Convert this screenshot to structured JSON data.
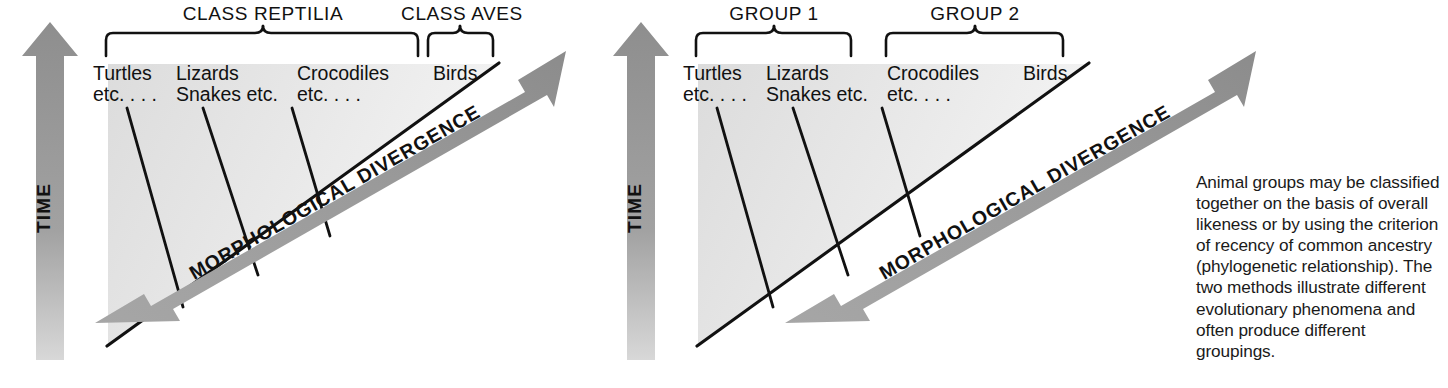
{
  "figure": {
    "background_color": "#ffffff",
    "wedge_fill_color": "#e6e6e6",
    "arrow_color": "#9a9a9a",
    "line_color": "#111111"
  },
  "panels": [
    {
      "id": "panel-left",
      "scheme": "phenetic",
      "time_axis_label": "TIME",
      "divergence_axis_label": "MORPHOLOGICAL DIVERGENCE",
      "group_labels": [
        {
          "text": "CLASS REPTILIA",
          "spans": [
            "Turtles etc....",
            "Lizards Snakes etc.",
            "Crocodiles etc...."
          ]
        },
        {
          "text": "CLASS AVES",
          "spans": [
            "Birds"
          ]
        }
      ],
      "leaves": [
        {
          "line1": "Turtles",
          "line2": "etc. . . ."
        },
        {
          "line1": "Lizards",
          "line2": "Snakes etc."
        },
        {
          "line1": "Crocodiles",
          "line2": "etc. . . ."
        },
        {
          "line1": "Birds",
          "line2": ""
        }
      ]
    },
    {
      "id": "panel-right",
      "scheme": "phylogenetic",
      "time_axis_label": "TIME",
      "divergence_axis_label": "MORPHOLOGICAL DIVERGENCE",
      "group_labels": [
        {
          "text": "GROUP 1",
          "spans": [
            "Turtles etc....",
            "Lizards Snakes etc."
          ]
        },
        {
          "text": "GROUP 2",
          "spans": [
            "Crocodiles etc....",
            "Birds"
          ]
        }
      ],
      "leaves": [
        {
          "line1": "Turtles",
          "line2": "etc. . . ."
        },
        {
          "line1": "Lizards",
          "line2": "Snakes etc."
        },
        {
          "line1": "Crocodiles",
          "line2": "etc. . . ."
        },
        {
          "line1": "Birds",
          "line2": ""
        }
      ]
    }
  ],
  "caption": {
    "text": "Animal groups may be classified together on the basis of overall likeness or by using the criterion of recency of common ancestry (phylogenetic relationship). The two methods illustrate different evolutionary phenomena and often produce different groupings."
  }
}
